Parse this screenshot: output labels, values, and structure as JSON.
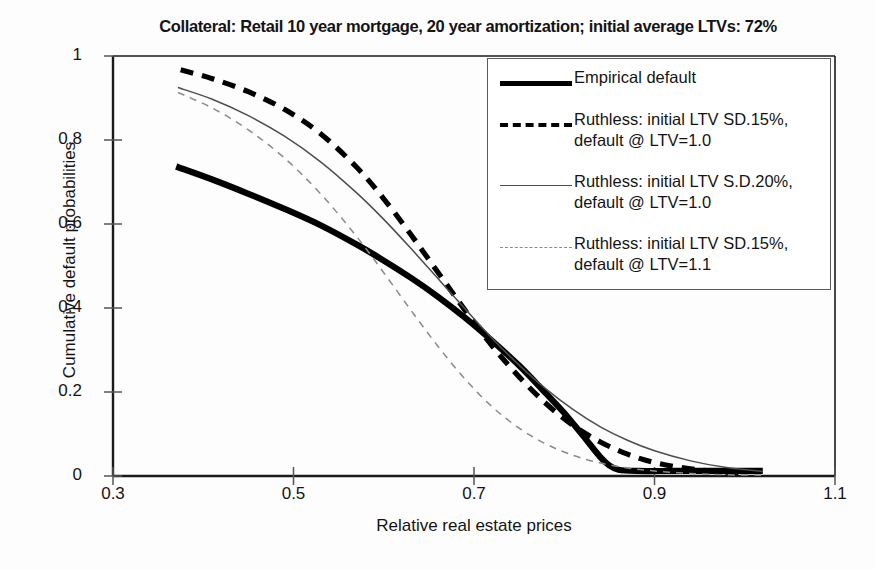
{
  "chart_data": {
    "type": "line",
    "title": "Collateral:  Retail 10 year mortgage, 20 year amortization; initial average LTVs:  72%",
    "xlabel": "Relative real estate prices",
    "ylabel": "Cumulative default probabilities",
    "xlim": [
      0.3,
      1.1
    ],
    "ylim": [
      0,
      1
    ],
    "xticks": [
      "0.3",
      "0.5",
      "0.7",
      "0.9",
      "1.1"
    ],
    "xtick_values": [
      0.3,
      0.5,
      0.7,
      0.9,
      1.1
    ],
    "yticks": [
      "0",
      "0.2",
      "0.4",
      "0.6",
      "0.8",
      "1"
    ],
    "ytick_values": [
      0,
      0.2,
      0.4,
      0.6,
      0.8,
      1
    ],
    "grid": false,
    "legend_position": "upper-right",
    "series": [
      {
        "name": "Empirical default",
        "style": "thick-solid",
        "color": "#000000",
        "x": [
          0.37,
          0.41,
          0.45,
          0.49,
          0.53,
          0.57,
          0.6,
          0.63,
          0.66,
          0.69,
          0.72,
          0.75,
          0.78,
          0.8,
          0.82,
          0.84,
          0.85,
          0.86,
          0.88,
          0.92,
          0.96,
          1.0,
          1.02
        ],
        "y": [
          0.737,
          0.706,
          0.672,
          0.636,
          0.597,
          0.551,
          0.513,
          0.472,
          0.427,
          0.377,
          0.322,
          0.263,
          0.196,
          0.15,
          0.098,
          0.045,
          0.025,
          0.015,
          0.012,
          0.012,
          0.012,
          0.012,
          0.012
        ]
      },
      {
        "name": "Ruthless:  initial LTV SD.15%,\ndefault @ LTV=1.0",
        "style": "thick-dashed",
        "color": "#000000",
        "x": [
          0.375,
          0.41,
          0.45,
          0.49,
          0.53,
          0.57,
          0.6,
          0.63,
          0.66,
          0.69,
          0.72,
          0.75,
          0.78,
          0.81,
          0.84,
          0.87,
          0.9,
          0.93,
          0.96,
          1.0
        ],
        "y": [
          0.967,
          0.946,
          0.915,
          0.873,
          0.815,
          0.735,
          0.66,
          0.575,
          0.485,
          0.395,
          0.31,
          0.236,
          0.172,
          0.12,
          0.081,
          0.052,
          0.032,
          0.02,
          0.012,
          0.006
        ]
      },
      {
        "name": "Ruthless:  initial LTV S.D.20%,\ndefault @ LTV=1.0",
        "style": "thin-solid",
        "color": "#4d4d4d",
        "x": [
          0.372,
          0.41,
          0.45,
          0.49,
          0.53,
          0.57,
          0.6,
          0.63,
          0.66,
          0.69,
          0.72,
          0.75,
          0.78,
          0.81,
          0.84,
          0.87,
          0.9,
          0.94,
          0.98,
          1.02
        ],
        "y": [
          0.925,
          0.897,
          0.858,
          0.809,
          0.748,
          0.674,
          0.611,
          0.542,
          0.47,
          0.398,
          0.328,
          0.264,
          0.207,
          0.158,
          0.117,
          0.085,
          0.06,
          0.036,
          0.02,
          0.011
        ]
      },
      {
        "name": "Ruthless:  initial LTV SD.15%,\ndefault @ LTV=1.1",
        "style": "thin-dashed",
        "color": "#8a8a8a",
        "x": [
          0.372,
          0.41,
          0.45,
          0.49,
          0.53,
          0.57,
          0.6,
          0.63,
          0.66,
          0.69,
          0.72,
          0.75,
          0.78,
          0.81,
          0.84,
          0.87,
          0.9,
          0.94,
          0.98,
          1.02
        ],
        "y": [
          0.913,
          0.876,
          0.824,
          0.757,
          0.672,
          0.57,
          0.484,
          0.395,
          0.309,
          0.231,
          0.165,
          0.114,
          0.076,
          0.049,
          0.031,
          0.019,
          0.012,
          0.006,
          0.003,
          0.002
        ]
      }
    ]
  },
  "legend": {
    "entries": [
      {
        "label": "Empirical default",
        "style": "thick-solid"
      },
      {
        "label": "Ruthless:  initial LTV SD.15%,\ndefault @ LTV=1.0",
        "style": "thick-dashed"
      },
      {
        "label": "Ruthless:  initial LTV S.D.20%,\ndefault @ LTV=1.0",
        "style": "thin-solid"
      },
      {
        "label": "Ruthless:  initial LTV SD.15%,\ndefault @ LTV=1.1",
        "style": "thin-dashed"
      }
    ]
  },
  "colors": {
    "axis": "#1a1a1a",
    "background": "#fdfdfd",
    "thick": "#000000",
    "thin": "#4d4d4d",
    "faint": "#8a8a8a"
  }
}
